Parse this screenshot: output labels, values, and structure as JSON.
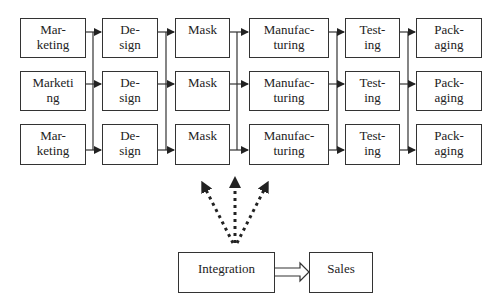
{
  "diagram": {
    "type": "process-flow",
    "stages": [
      "Mar-\nketing",
      "De-\nsign",
      "Mask",
      "Manufac-\nturing",
      "Test-\ning",
      "Pack-\naging"
    ],
    "rows": [
      {
        "labels": [
          "Mar-\nketing",
          "De-\nsign",
          "Mask",
          "Manufac-\nturing",
          "Test-\ning",
          "Pack-\naging"
        ]
      },
      {
        "labels": [
          "Marketi\nng",
          "De-\nsign",
          "Mask",
          "Manufac-\nturing",
          "Test-\ning",
          "Pack-\naging"
        ]
      },
      {
        "labels": [
          "Mar-\nketing",
          "De-\nsign",
          "Mask",
          "Manufac-\nturing",
          "Test-\ning",
          "Pack-\naging"
        ]
      }
    ],
    "bottom": {
      "integration": "Integration",
      "sales": "Sales"
    },
    "colors": {
      "stroke": "#333333",
      "fill": "#ffffff",
      "text": "#222222"
    }
  }
}
